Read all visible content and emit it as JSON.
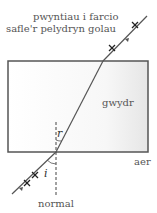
{
  "labels": {
    "marking_points_line1": "pwyntiau i farcio",
    "marking_points_line2": "safle'r pelydryn golau",
    "glass": "gwydr",
    "air": "aer",
    "normal": "normal",
    "angle_refraction": "r",
    "angle_incidence": "i"
  },
  "colors": {
    "block_fill": "#f2f2f2",
    "block_edge": "#555555",
    "ray": "#555555",
    "text": "#555555"
  }
}
